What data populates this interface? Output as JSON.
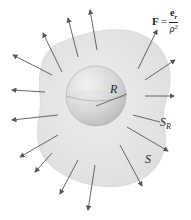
{
  "formula": {
    "lhs": "F",
    "equals": "=",
    "numerator": "e",
    "numerator_sub": "r",
    "denominator": "ρ²"
  },
  "labels": {
    "radius": "R",
    "sphere_surface": "S",
    "sphere_surface_sub": "R",
    "outer_surface": "S"
  },
  "colors": {
    "outer_surface_fill": "#e4e4e4",
    "sphere_fill": "#cfcfcf",
    "arrow": "#555555",
    "text": "#222222"
  },
  "arrows_count": 16
}
